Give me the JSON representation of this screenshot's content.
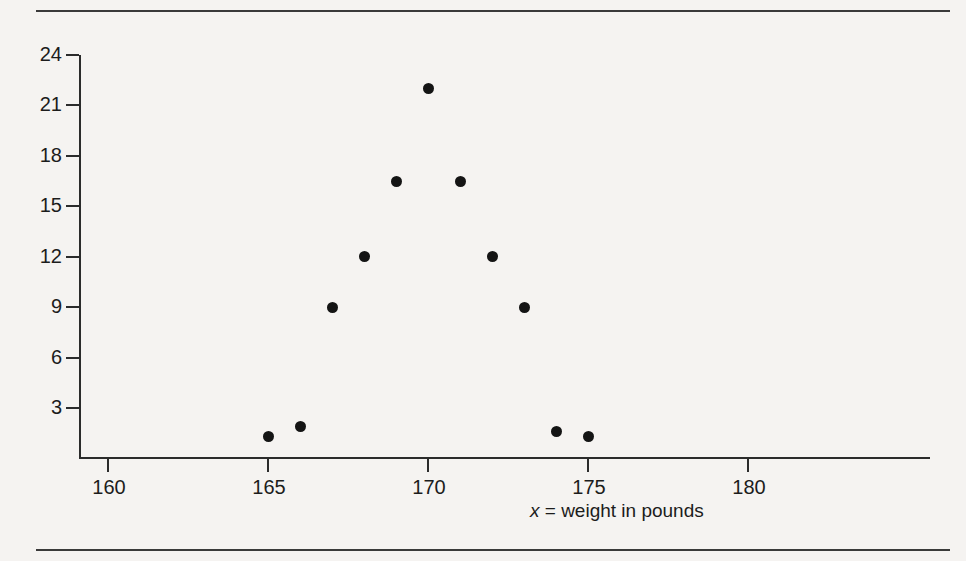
{
  "figure": {
    "background_color": "#f5f3f1",
    "ink_color": "#1c1c1c",
    "rules": {
      "top_label": "top-horizontal-rule",
      "bottom_label": "bottom-horizontal-rule"
    }
  },
  "chart_data": {
    "type": "scatter",
    "title": "",
    "subtitle": "",
    "xlabel": "x = weight in pounds",
    "xlabel_variable": "x",
    "xlabel_rest": " = weight in pounds",
    "ylabel": "",
    "xlim": [
      158.6,
      179.8
    ],
    "ylim": [
      0.0,
      24.0
    ],
    "xticks": [
      160,
      165,
      170,
      175,
      180
    ],
    "xtick_labels": [
      "160",
      "165",
      "170",
      "175",
      "180"
    ],
    "yticks": [
      3,
      6,
      9,
      12,
      15,
      18,
      21,
      24
    ],
    "ytick_labels": [
      "3",
      "6",
      "9",
      "12",
      "15",
      "18",
      "21",
      "24"
    ],
    "grid": false,
    "legend": null,
    "legend_position": "none",
    "marker": "filled-circle",
    "marker_color": "#141414",
    "points": [
      {
        "x": 165,
        "y": 1.3
      },
      {
        "x": 166,
        "y": 1.9
      },
      {
        "x": 167,
        "y": 9.0
      },
      {
        "x": 168,
        "y": 12.0
      },
      {
        "x": 169,
        "y": 16.5
      },
      {
        "x": 170,
        "y": 22.0
      },
      {
        "x": 171,
        "y": 16.5
      },
      {
        "x": 172,
        "y": 12.0
      },
      {
        "x": 173,
        "y": 9.0
      },
      {
        "x": 174,
        "y": 1.6
      },
      {
        "x": 175,
        "y": 1.3
      }
    ]
  }
}
